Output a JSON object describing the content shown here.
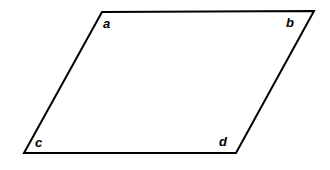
{
  "figure": {
    "name": "parallelogram",
    "background_color": "#ffffff",
    "stroke_color": "#000000",
    "stroke_width": 2,
    "fill_color": "#ffffff",
    "canvas": {
      "width": 330,
      "height": 170
    },
    "vertices": [
      {
        "id": "a",
        "label": "a",
        "x": 102,
        "y": 12,
        "label_x": 103,
        "label_y": 17,
        "corner": "top-left"
      },
      {
        "id": "b",
        "label": "b",
        "x": 314,
        "y": 11,
        "label_x": 286,
        "label_y": 16,
        "corner": "top-right"
      },
      {
        "id": "c",
        "label": "c",
        "x": 24,
        "y": 153,
        "label_x": 35,
        "label_y": 136,
        "corner": "bottom-left"
      },
      {
        "id": "d",
        "label": "d",
        "x": 236,
        "y": 153,
        "label_x": 219,
        "label_y": 135,
        "corner": "bottom-right"
      }
    ],
    "edges": [
      {
        "id": "edge-ab",
        "from": "a",
        "to": "b"
      },
      {
        "id": "edge-bd",
        "from": "b",
        "to": "d"
      },
      {
        "id": "edge-dc",
        "from": "d",
        "to": "c"
      },
      {
        "id": "edge-ca",
        "from": "c",
        "to": "a"
      }
    ],
    "path": "M 102 12 L 314 11 L 236 153 L 24 153 Z"
  },
  "labels": {
    "a": "a",
    "b": "b",
    "c": "c",
    "d": "d"
  }
}
